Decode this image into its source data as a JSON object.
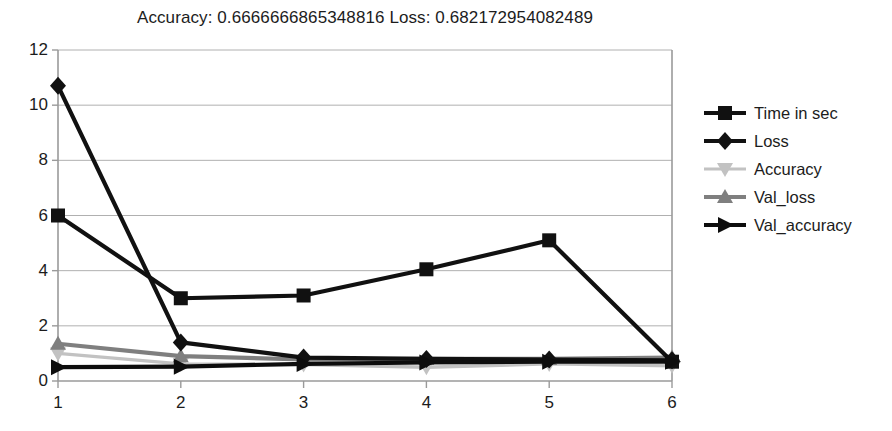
{
  "chart_data": {
    "type": "line",
    "title": "Accuracy:  0.6666666865348816 Loss:  0.682172954082489",
    "xlabel": "",
    "ylabel": "",
    "x": [
      1,
      2,
      3,
      4,
      5,
      6
    ],
    "categories": [
      "1",
      "2",
      "3",
      "4",
      "5",
      "6"
    ],
    "xtick_labels": [
      "1",
      "2",
      "3",
      "4",
      "5",
      "6"
    ],
    "ytick_labels": [
      "0",
      "2",
      "4",
      "6",
      "8",
      "10",
      "12"
    ],
    "yticks": [
      0,
      2,
      4,
      6,
      8,
      10,
      12
    ],
    "ylim": [
      0,
      12
    ],
    "xlim": [
      1,
      6
    ],
    "grid": "horizontal",
    "legend_position": "right",
    "series": [
      {
        "name": "Time in sec",
        "values": [
          6.0,
          3.0,
          3.1,
          4.05,
          5.1,
          0.7
        ],
        "color": "#111111",
        "marker": "square"
      },
      {
        "name": "Loss",
        "values": [
          10.7,
          1.4,
          0.85,
          0.8,
          0.78,
          0.75
        ],
        "color": "#111111",
        "marker": "diamond"
      },
      {
        "name": "Accuracy",
        "values": [
          1.0,
          0.62,
          0.6,
          0.5,
          0.62,
          0.55
        ],
        "color": "#c2c2c2",
        "marker": "triangle-down"
      },
      {
        "name": "Val_loss",
        "values": [
          1.35,
          0.9,
          0.78,
          0.8,
          0.8,
          0.85
        ],
        "color": "#7f7f7f",
        "marker": "triangle-up"
      },
      {
        "name": "Val_accuracy",
        "values": [
          0.5,
          0.52,
          0.62,
          0.67,
          0.7,
          0.7
        ],
        "color": "#0d0d0d",
        "marker": "triangle-right"
      }
    ]
  },
  "axes": {
    "grid_color": "#b0b0b0",
    "axis_color": "#9a9a9a"
  }
}
